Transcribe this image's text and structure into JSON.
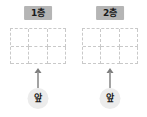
{
  "diagram": {
    "type": "seating-floor-plan",
    "colors": {
      "title_chip_bg": "#b5b5b5",
      "title_chip_text": "#1a1a1a",
      "grid_line": "#c9c9c9",
      "cell_bg": "#ffffff",
      "arrow": "#808080",
      "badge_bg": "#ececec",
      "badge_text": "#1a1a1a",
      "page_bg": "#ffffff"
    },
    "floors": [
      {
        "id": "floor-1",
        "title": "1층",
        "grid": {
          "columns": 3,
          "rows": 2,
          "cells": [
            "",
            "",
            "",
            "",
            "",
            ""
          ],
          "line_style": "dashed"
        },
        "direction_marker": {
          "arrow_icon": "arrow-up-icon",
          "arrow_direction": "up",
          "label": "앞"
        }
      },
      {
        "id": "floor-2",
        "title": "2층",
        "grid": {
          "columns": 3,
          "rows": 2,
          "cells": [
            "",
            "",
            "",
            "",
            "",
            ""
          ],
          "line_style": "dashed"
        },
        "direction_marker": {
          "arrow_icon": "arrow-up-icon",
          "arrow_direction": "up",
          "label": "앞"
        }
      }
    ]
  }
}
